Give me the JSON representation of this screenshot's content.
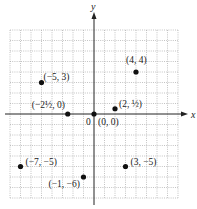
{
  "chart_data": {
    "type": "scatter",
    "title": "",
    "xlabel": "x",
    "ylabel": "y",
    "xlim": [
      -8,
      8
    ],
    "ylim": [
      -8,
      8
    ],
    "grid": true,
    "grid_style": "dotted",
    "legend": null,
    "origin_label": "0",
    "points": [
      {
        "x": 0,
        "y": 0,
        "label": "(0, 0)"
      },
      {
        "x": 4,
        "y": 4,
        "label": "(4, 4)"
      },
      {
        "x": -5,
        "y": 3,
        "label": "(−5, 3)"
      },
      {
        "x": -2.5,
        "y": 0,
        "label": "(−2½, 0)"
      },
      {
        "x": 2,
        "y": 0.5,
        "label": "(2, ½)"
      },
      {
        "x": -7,
        "y": -5,
        "label": "(−7, −5)"
      },
      {
        "x": 3,
        "y": -5,
        "label": "(3, −5)"
      },
      {
        "x": -1,
        "y": -6,
        "label": "(−1, −6)"
      }
    ]
  },
  "layout": {
    "origin_px": [
      94,
      114
    ],
    "unit_px": 10.5,
    "axis_color": "#222222",
    "grid_color": "#9a9a9a",
    "point_color": "#111111",
    "label_offsets": [
      [
        4,
        11
      ],
      [
        -10,
        -9
      ],
      [
        2,
        -3
      ],
      [
        -36,
        -6
      ],
      [
        4,
        -2
      ],
      [
        5,
        -2
      ],
      [
        5,
        -2
      ],
      [
        -35,
        10
      ]
    ]
  }
}
